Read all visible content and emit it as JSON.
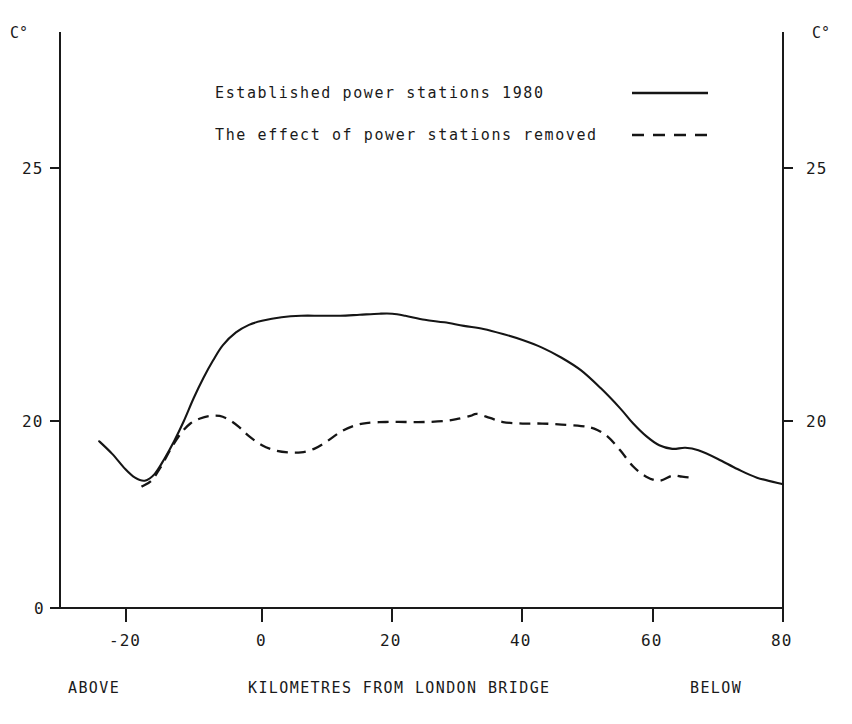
{
  "chart_data": {
    "type": "line",
    "title": "",
    "xlabel": "KILOMETRES FROM LONDON BRIDGE",
    "ylabel": "C°",
    "xlim": [
      -25,
      80
    ],
    "ylim": [
      0,
      27
    ],
    "grid": false,
    "legend_position": "top-center",
    "y_axis_note": "broken axis: 0 at baseline then resumes near 18",
    "xticks": [
      -20,
      0,
      20,
      40,
      60,
      80
    ],
    "xtick_labels": [
      "-20",
      "0",
      "20",
      "40",
      "60",
      "80"
    ],
    "yticks": [
      0,
      20,
      25
    ],
    "ytick_labels": [
      "0",
      "20",
      "25"
    ],
    "series": [
      {
        "name": "Established power stations 1980",
        "style": "solid",
        "x": [
          -25,
          -23,
          -21,
          -19.5,
          -18,
          -16.5,
          -15,
          -13.5,
          -12,
          -10.5,
          -9,
          -7.5,
          -6,
          -4,
          -2,
          0,
          3,
          6,
          9,
          12,
          15,
          18,
          20,
          22,
          25,
          28,
          31,
          34,
          37,
          40,
          43,
          46,
          49,
          52,
          55,
          57,
          59,
          61,
          63,
          65,
          67,
          70,
          73,
          76,
          80
        ],
        "y": [
          19.6,
          19.35,
          19.05,
          18.88,
          18.82,
          18.95,
          19.25,
          19.6,
          20.0,
          20.45,
          20.85,
          21.2,
          21.5,
          21.75,
          21.9,
          21.98,
          22.05,
          22.08,
          22.08,
          22.08,
          22.1,
          22.12,
          22.12,
          22.08,
          22.0,
          21.95,
          21.88,
          21.82,
          21.72,
          21.6,
          21.45,
          21.25,
          21.0,
          20.65,
          20.25,
          19.95,
          19.7,
          19.52,
          19.45,
          19.47,
          19.42,
          19.25,
          19.05,
          18.88,
          18.75
        ]
      },
      {
        "name": "The effect of power stations removed",
        "style": "dashed",
        "x": [
          -18.5,
          -17,
          -15.5,
          -14,
          -12.5,
          -11,
          -9.5,
          -8,
          -6.5,
          -5,
          -3.5,
          -2,
          0,
          2,
          4,
          6,
          8,
          10,
          12,
          14,
          16,
          19,
          22,
          25,
          28,
          30,
          32,
          33,
          35,
          37,
          40,
          43,
          46,
          49,
          51,
          53,
          55,
          57,
          59,
          61,
          63,
          64.5,
          66
        ],
        "y": [
          18.7,
          18.82,
          19.1,
          19.45,
          19.75,
          19.95,
          20.05,
          20.1,
          20.1,
          20.02,
          19.88,
          19.7,
          19.52,
          19.42,
          19.38,
          19.38,
          19.45,
          19.6,
          19.78,
          19.9,
          19.96,
          19.98,
          19.98,
          19.98,
          20.0,
          20.04,
          20.1,
          20.14,
          20.06,
          19.98,
          19.95,
          19.95,
          19.93,
          19.9,
          19.85,
          19.7,
          19.42,
          19.1,
          18.9,
          18.82,
          18.92,
          18.9,
          18.88
        ]
      }
    ]
  },
  "axis": {
    "unit_left": "C°",
    "unit_right": "C°"
  },
  "legend": {
    "items": [
      {
        "label": "Established power stations 1980",
        "style": "solid"
      },
      {
        "label": "The effect of power stations removed",
        "style": "dashed"
      }
    ]
  },
  "footer": {
    "left": "ABOVE",
    "center": "KILOMETRES FROM LONDON BRIDGE",
    "right": "BELOW"
  },
  "ticks": {
    "y": [
      {
        "label": "25",
        "value": 25
      },
      {
        "label": "20",
        "value": 20
      },
      {
        "label": "0",
        "value": 0
      }
    ],
    "x": [
      {
        "label": "-20",
        "value": -20
      },
      {
        "label": "0",
        "value": 0
      },
      {
        "label": "20",
        "value": 20
      },
      {
        "label": "40",
        "value": 40
      },
      {
        "label": "60",
        "value": 60
      },
      {
        "label": "80",
        "value": 80
      }
    ]
  }
}
